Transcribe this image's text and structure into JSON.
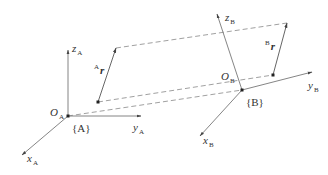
{
  "diagram": {
    "colors": {
      "line": "#555555",
      "text": "#333333",
      "background": "#ffffff"
    },
    "frame_a": {
      "name": "{A}",
      "origin_label": "O",
      "origin_sub": "A",
      "x_label": "x",
      "x_sub": "A",
      "y_label": "y",
      "y_sub": "A",
      "z_label": "z",
      "z_sub": "A"
    },
    "frame_b": {
      "name": "{B}",
      "origin_label": "O",
      "origin_sub": "B",
      "x_label": "x",
      "x_sub": "B",
      "y_label": "y",
      "y_sub": "B",
      "z_label": "z",
      "z_sub": "B"
    },
    "vector_a": {
      "sup": "A",
      "label": "r"
    },
    "vector_b": {
      "sup": "B",
      "label": "r"
    }
  }
}
